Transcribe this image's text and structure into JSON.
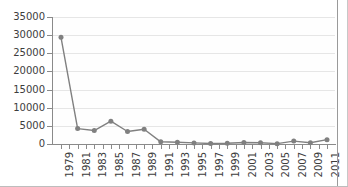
{
  "chart_data": {
    "type": "line",
    "title": "",
    "subtitle": "",
    "xlabel": "",
    "ylabel": "",
    "x": [
      1979,
      1981,
      1983,
      1985,
      1987,
      1989,
      1991,
      1993,
      1995,
      1997,
      1999,
      2001,
      2003,
      2005,
      2007,
      2009,
      2011
    ],
    "categories": [
      "1979",
      "1981",
      "1983",
      "1985",
      "1987",
      "1989",
      "1991",
      "1993",
      "1995",
      "1997",
      "1999",
      "2001",
      "2003",
      "2005",
      "2007",
      "2009",
      "2011"
    ],
    "values": [
      29400,
      4250,
      3700,
      6300,
      3450,
      4050,
      600,
      500,
      300,
      150,
      200,
      400,
      350,
      100,
      800,
      350,
      1200
    ],
    "series": [
      {
        "name": "series-1",
        "values": [
          29400,
          4250,
          3700,
          6300,
          3450,
          4050,
          600,
          500,
          300,
          150,
          200,
          400,
          350,
          100,
          800,
          350,
          1200
        ]
      }
    ],
    "ylim": [
      0,
      35000
    ],
    "xlim": [
      1979,
      2011
    ],
    "ytick_values": [
      0,
      5000,
      10000,
      15000,
      20000,
      25000,
      30000,
      35000
    ],
    "ytick_labels": [
      "0",
      "5000",
      "10000",
      "15000",
      "20000",
      "25000",
      "30000",
      "35000"
    ],
    "xtick_labels": [
      "1979",
      "1981",
      "1983",
      "1985",
      "1987",
      "1989",
      "1991",
      "1993",
      "1995",
      "1997",
      "1999",
      "2001",
      "2003",
      "2005",
      "2007",
      "2009",
      "2011"
    ],
    "xtick_label_rotation": 90,
    "grid": true,
    "grid_axis": "y",
    "legend": false,
    "legend_position": "none",
    "marker": "circle",
    "colors": {
      "line": "#808080",
      "marker": "#808080",
      "grid": "#e6e6e6",
      "axis": "#8a8a8a",
      "text": "#3d3d3d",
      "background": "#ffffff",
      "frame": "#9a9a9a"
    }
  }
}
